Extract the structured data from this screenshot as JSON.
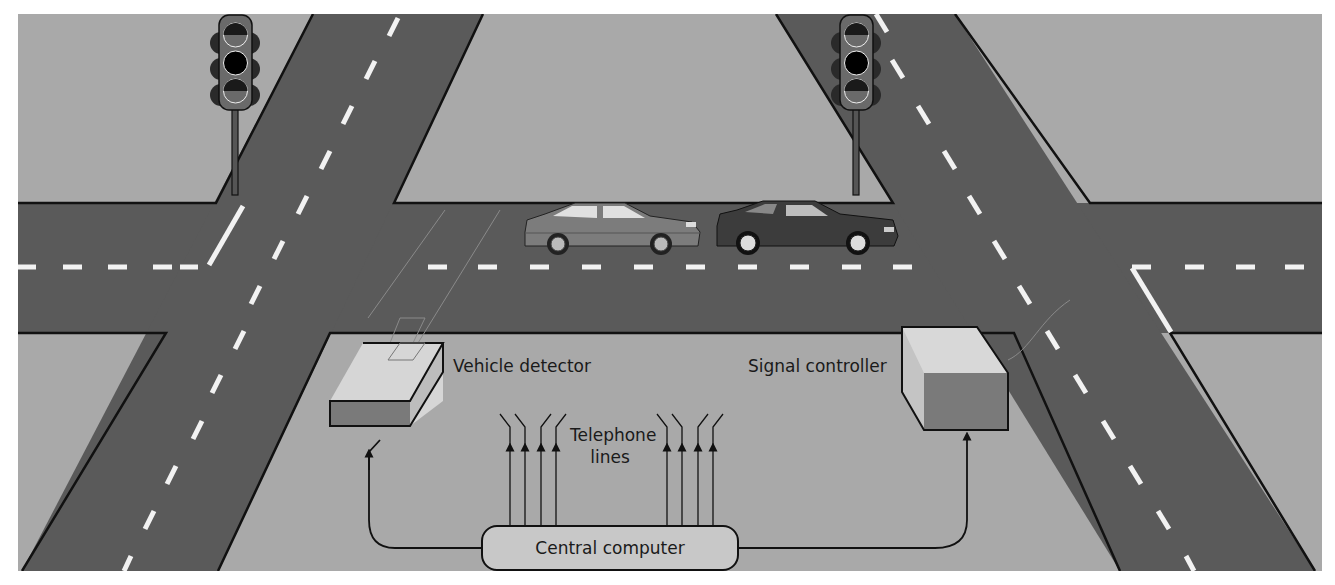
{
  "figure": {
    "labels": {
      "vehicle_detector": "Vehicle detector",
      "signal_controller": "Signal controller",
      "telephone_lines_1": "Telephone",
      "telephone_lines_2": "lines",
      "central_computer": "Central computer"
    },
    "components": [
      {
        "name": "traffic-light-left",
        "type": "traffic signal",
        "lamps": 3
      },
      {
        "name": "traffic-light-right",
        "type": "traffic signal",
        "lamps": 3
      },
      {
        "name": "car-sedan",
        "type": "vehicle"
      },
      {
        "name": "car-coupe",
        "type": "vehicle"
      },
      {
        "name": "vehicle-detector",
        "type": "box"
      },
      {
        "name": "signal-controller",
        "type": "box"
      },
      {
        "name": "central-computer",
        "type": "rounded box"
      }
    ],
    "connections": [
      {
        "from": "central-computer",
        "to": "vehicle-detector",
        "direction": "arrow up"
      },
      {
        "from": "central-computer",
        "to": "signal-controller",
        "direction": "arrow up"
      },
      {
        "from": "central-computer",
        "to": "telephone-lines-left",
        "count": 4
      },
      {
        "from": "central-computer",
        "to": "telephone-lines-right",
        "count": 4
      }
    ],
    "colors": {
      "ground": "#a9a9a9",
      "road": "#5a5a5a",
      "road_marking": "#f2f2f2",
      "outline": "#111111",
      "box_top": "#d6d6d6",
      "box_front": "#7a7a7a",
      "central_box": "#c8c8c8"
    }
  }
}
